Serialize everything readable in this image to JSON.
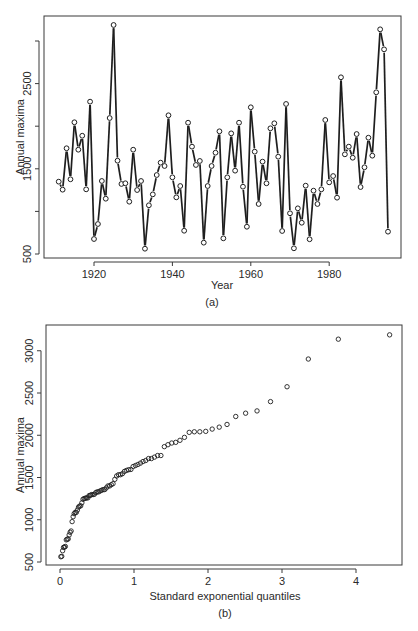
{
  "chart_data": [
    {
      "id": "a",
      "type": "line",
      "marker": "open-circle",
      "title": "",
      "caption": "(a)",
      "xlabel": "Year",
      "ylabel": "Annual maxima",
      "xlim": [
        1908,
        1998
      ],
      "ylim": [
        450,
        3290
      ],
      "xticks": [
        1920,
        1940,
        1960,
        1980
      ],
      "xtick_labels": [
        "1920",
        "1940",
        "1960",
        "1980"
      ],
      "yticks": [
        500,
        1000,
        1500,
        2000,
        2500,
        3000
      ],
      "ytick_labels": [
        "500",
        "",
        "1500",
        "",
        "2500",
        ""
      ],
      "grid": false,
      "legend": null,
      "x": [
        1911,
        1912,
        1913,
        1914,
        1915,
        1916,
        1917,
        1918,
        1919,
        1920,
        1921,
        1922,
        1923,
        1924,
        1925,
        1926,
        1927,
        1928,
        1929,
        1930,
        1931,
        1932,
        1933,
        1934,
        1935,
        1936,
        1937,
        1938,
        1939,
        1940,
        1941,
        1942,
        1943,
        1944,
        1945,
        1946,
        1947,
        1948,
        1949,
        1950,
        1951,
        1952,
        1953,
        1954,
        1955,
        1956,
        1957,
        1958,
        1959,
        1960,
        1961,
        1962,
        1963,
        1964,
        1965,
        1966,
        1967,
        1968,
        1969,
        1970,
        1971,
        1972,
        1973,
        1974,
        1975,
        1976,
        1977,
        1978,
        1979,
        1980,
        1981,
        1982,
        1983,
        1984,
        1985,
        1986,
        1987,
        1988,
        1989,
        1990,
        1991,
        1992,
        1993,
        1994,
        1995
      ],
      "values": [
        1349,
        1255,
        1741,
        1377,
        2046,
        1724,
        1888,
        1259,
        2288,
        676,
        852,
        1357,
        1149,
        2096,
        3188,
        1595,
        1322,
        1330,
        1114,
        1724,
        1251,
        1357,
        562,
        1072,
        1200,
        1427,
        1572,
        1533,
        2128,
        1400,
        1165,
        1298,
        773,
        2041,
        1760,
        1545,
        1592,
        633,
        1298,
        1533,
        1689,
        1940,
        684,
        1400,
        1916,
        1478,
        2041,
        1290,
        820,
        2222,
        1701,
        1087,
        1584,
        1330,
        1975,
        2034,
        1642,
        770,
        2261,
        978,
        567,
        1036,
        867,
        1302,
        673,
        1243,
        1087,
        1259,
        2073,
        1341,
        1415,
        1161,
        2574,
        1670,
        1760,
        1630,
        1908,
        1286,
        1518,
        1865,
        1654,
        2398,
        3137,
        2902,
        762
      ]
    },
    {
      "id": "b",
      "type": "scatter",
      "marker": "open-circle",
      "title": "",
      "caption": "(b)",
      "xlabel": "Standard exponential quantiles",
      "ylabel": "Annual maxima",
      "xlim": [
        -0.19,
        4.63
      ],
      "ylim": [
        460,
        3220
      ],
      "xticks": [
        0,
        1,
        2,
        3,
        4
      ],
      "xtick_labels": [
        "0",
        "1",
        "2",
        "3",
        "4"
      ],
      "yticks": [
        500,
        1000,
        1500,
        2000,
        2500,
        3000
      ],
      "ytick_labels": [
        "500",
        "1000",
        "1500",
        "2000",
        "2500",
        "3000"
      ],
      "grid": false,
      "legend": null,
      "x_formula": "-ln(1 - i/(n+1)), i = 1..n, n = 85",
      "values_sorted_from": "a"
    }
  ],
  "labels": {
    "a_caption": "(a)",
    "a_xlabel": "Year",
    "a_ylabel": "Annual maxima",
    "b_caption": "(b)",
    "b_xlabel": "Standard exponential quantiles",
    "b_ylabel": "Annual maxima"
  },
  "colors": {
    "ink": "#1e1e1e",
    "frame": "#3a3a3a",
    "background": "#ffffff"
  }
}
